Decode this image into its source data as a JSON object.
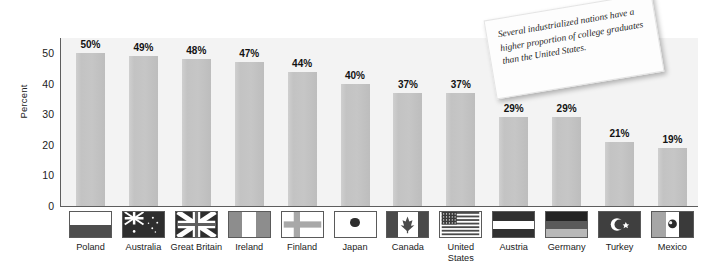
{
  "chart_data": {
    "type": "bar",
    "title": "",
    "xlabel": "",
    "ylabel": "Percent",
    "ylim": [
      0,
      55
    ],
    "yticks": [
      0,
      10,
      20,
      30,
      40,
      50
    ],
    "grid": false,
    "legend": "none",
    "categories": [
      "Poland",
      "Australia",
      "Great Britain",
      "Ireland",
      "Finland",
      "Japan",
      "Canada",
      "United States",
      "Austria",
      "Germany",
      "Turkey",
      "Mexico"
    ],
    "values": [
      50,
      49,
      48,
      47,
      44,
      40,
      37,
      37,
      29,
      29,
      21,
      19
    ],
    "value_labels": [
      "50%",
      "49%",
      "48%",
      "47%",
      "44%",
      "40%",
      "37%",
      "37%",
      "29%",
      "29%",
      "21%",
      "19%"
    ],
    "annotations": [
      "Several industrialized nations have a higher proportion of college graduates than the United States."
    ]
  },
  "axis": {
    "y_title": "Percent",
    "y_ticks": [
      "0",
      "10",
      "20",
      "30",
      "40",
      "50"
    ]
  },
  "callout": {
    "text": "Several industrialized nations have a higher proportion of college graduates than the United States."
  },
  "flags": [
    {
      "country": "Poland",
      "icon": "flag-poland-icon"
    },
    {
      "country": "Australia",
      "icon": "flag-australia-icon"
    },
    {
      "country": "Great Britain",
      "icon": "flag-great-britain-icon"
    },
    {
      "country": "Ireland",
      "icon": "flag-ireland-icon"
    },
    {
      "country": "Finland",
      "icon": "flag-finland-icon"
    },
    {
      "country": "Japan",
      "icon": "flag-japan-icon"
    },
    {
      "country": "Canada",
      "icon": "flag-canada-icon"
    },
    {
      "country": "United States",
      "icon": "flag-united-states-icon"
    },
    {
      "country": "Austria",
      "icon": "flag-austria-icon"
    },
    {
      "country": "Germany",
      "icon": "flag-germany-icon"
    },
    {
      "country": "Turkey",
      "icon": "flag-turkey-icon"
    },
    {
      "country": "Mexico",
      "icon": "flag-mexico-icon"
    }
  ],
  "colors": {
    "bar": "#c4c4c4",
    "plot_background": "#f3f3f3",
    "axis": "#5e5e5e",
    "page_background": "#ffffff",
    "note_background": "#fdfdfd"
  }
}
